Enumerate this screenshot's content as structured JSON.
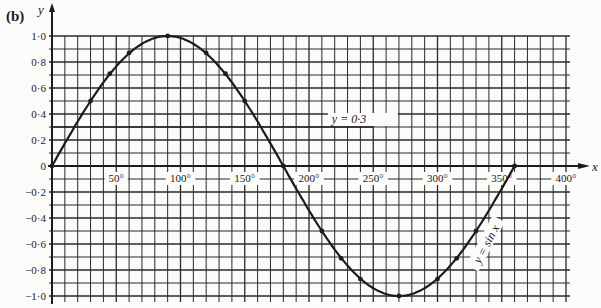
{
  "part_label": "(b)",
  "chart_data": {
    "type": "line",
    "title": "",
    "xlabel": "x",
    "ylabel": "y",
    "xlim": [
      0,
      400
    ],
    "ylim": [
      -1.0,
      1.0
    ],
    "grid": true,
    "grid_step_x": 10,
    "grid_step_y": 0.1,
    "x_ticks": [
      {
        "value": 50,
        "label": "50°"
      },
      {
        "value": 100,
        "label": "100°"
      },
      {
        "value": 150,
        "label": "150°"
      },
      {
        "value": 200,
        "label": "200°"
      },
      {
        "value": 250,
        "label": "250°"
      },
      {
        "value": 300,
        "label": "300°"
      },
      {
        "value": 350,
        "label": "350°"
      },
      {
        "value": 400,
        "label": "400°"
      }
    ],
    "y_ticks": [
      {
        "value": 1.0,
        "label": "1·0"
      },
      {
        "value": 0.8,
        "label": "0·8"
      },
      {
        "value": 0.6,
        "label": "0·6"
      },
      {
        "value": 0.4,
        "label": "0·4"
      },
      {
        "value": 0.2,
        "label": "0·2"
      },
      {
        "value": 0,
        "label": "0"
      },
      {
        "value": -0.2,
        "label": "−0·2"
      },
      {
        "value": -0.4,
        "label": "−0·4"
      },
      {
        "value": -0.6,
        "label": "−0·6"
      },
      {
        "value": -0.8,
        "label": "−0·8"
      },
      {
        "value": -1.0,
        "label": "−1·0"
      }
    ],
    "series": [
      {
        "name": "y = sin x",
        "label": "y = sin x",
        "kind": "curve",
        "x": [
          0,
          30,
          45,
          60,
          90,
          120,
          135,
          150,
          180,
          210,
          225,
          240,
          270,
          300,
          315,
          330,
          360
        ],
        "y": [
          0,
          0.5,
          0.71,
          0.87,
          1.0,
          0.87,
          0.71,
          0.5,
          0,
          -0.5,
          -0.71,
          -0.87,
          -1.0,
          -0.87,
          -0.71,
          -0.5,
          0
        ]
      },
      {
        "name": "y = 0.3",
        "label": "y = 0·3",
        "kind": "horizontal-line",
        "x": [
          0,
          250
        ],
        "y": [
          0.3,
          0.3
        ]
      }
    ],
    "legend": "none (inline labels on curves)"
  },
  "colors": {
    "ink": "#1c1c1c",
    "grid": "#2a2a2a",
    "paper": "#fbfbf9"
  }
}
